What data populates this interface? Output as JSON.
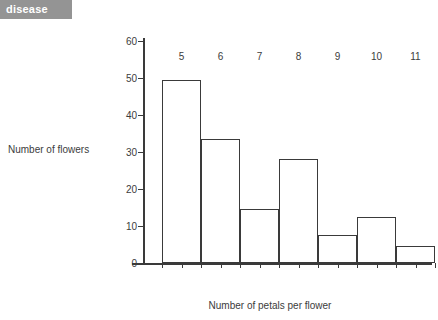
{
  "tag": {
    "label": "disease"
  },
  "chart_data": {
    "type": "bar",
    "title": "",
    "xlabel": "Number of petals per flower",
    "ylabel": "Number of flowers",
    "categories": [
      "5",
      "6",
      "7",
      "8",
      "9",
      "10",
      "11"
    ],
    "values": [
      49.5,
      33.5,
      14.5,
      28,
      7.5,
      12.5,
      4.5
    ],
    "ylim": [
      0,
      60
    ],
    "y_ticks": [
      "0",
      "10",
      "20",
      "30",
      "40",
      "50",
      "60"
    ],
    "grid": false,
    "legend": null,
    "bar_style": {
      "fill": "#ffffff",
      "stroke": "#3a3a3a"
    }
  },
  "colors": {
    "tag_background": "#949494",
    "tag_text": "#ffffff",
    "axis": "#3a3a3a",
    "text": "#3c3c3c",
    "background": "#ffffff"
  }
}
